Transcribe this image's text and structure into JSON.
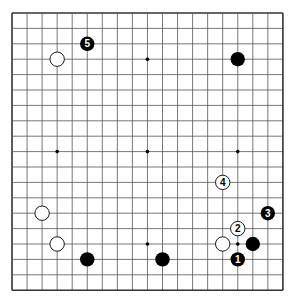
{
  "board": {
    "size": 19,
    "origin_x": 12,
    "origin_y": 13,
    "step_x": 15.05,
    "step_y": 15.4,
    "line_color": "#555555",
    "border_color": "#333333",
    "stone_black": "#000000",
    "stone_white": "#ffffff",
    "star_points": [
      [
        3,
        3
      ],
      [
        9,
        3
      ],
      [
        15,
        3
      ],
      [
        3,
        9
      ],
      [
        9,
        9
      ],
      [
        15,
        9
      ],
      [
        3,
        15
      ],
      [
        9,
        15
      ],
      [
        15,
        15
      ]
    ]
  },
  "stones": [
    {
      "color": "black",
      "col": 5,
      "row": 2,
      "label": "5"
    },
    {
      "color": "white",
      "col": 3,
      "row": 3,
      "label": ""
    },
    {
      "color": "black",
      "col": 15,
      "row": 3,
      "label": ""
    },
    {
      "color": "white",
      "col": 14,
      "row": 11,
      "label": "4"
    },
    {
      "color": "black",
      "col": 17,
      "row": 13,
      "label": "3"
    },
    {
      "color": "white",
      "col": 2,
      "row": 13,
      "label": ""
    },
    {
      "color": "white",
      "col": 15,
      "row": 14,
      "label": "2"
    },
    {
      "color": "white",
      "col": 3,
      "row": 15,
      "label": ""
    },
    {
      "color": "white",
      "col": 14,
      "row": 15,
      "label": ""
    },
    {
      "color": "black",
      "col": 16,
      "row": 15,
      "label": ""
    },
    {
      "color": "black",
      "col": 5,
      "row": 16,
      "label": ""
    },
    {
      "color": "black",
      "col": 10,
      "row": 16,
      "label": ""
    },
    {
      "color": "black",
      "col": 15,
      "row": 16,
      "label": "1"
    }
  ]
}
